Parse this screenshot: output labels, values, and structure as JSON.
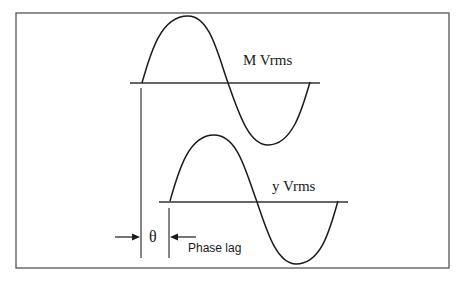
{
  "diagram": {
    "frame": {
      "x": 16,
      "y": 13,
      "width": 433,
      "height": 255,
      "stroke": "#555555"
    },
    "waves": [
      {
        "id": "reference",
        "label": "M Vrms",
        "label_pos": {
          "x": 243,
          "y": 65
        },
        "baseline": {
          "x1": 130,
          "x2": 320,
          "y": 83
        },
        "path": "M142,83 C150,55 160,16 188,16 C210,16 218,55 228,83 C238,110 248,145 268,145 C292,145 302,110 310,82"
      },
      {
        "id": "response",
        "label": "y Vrms",
        "label_pos": {
          "x": 272,
          "y": 191
        },
        "baseline": {
          "x1": 159,
          "x2": 348,
          "y": 202
        },
        "path": "M170,201 C178,173 188,135 214,135 C238,135 246,173 257,202 C266,228 276,264 296,264 C322,264 330,228 338,201"
      }
    ],
    "phase_markers": {
      "left_line": {
        "x": 141,
        "y1": 88,
        "y2": 258
      },
      "right_line": {
        "x": 169,
        "y1": 208,
        "y2": 258
      },
      "left_arrow": {
        "x1": 115,
        "x2": 140,
        "y": 237
      },
      "right_arrow": {
        "x1": 196,
        "x2": 170,
        "y": 237
      }
    },
    "labels": {
      "theta": "θ",
      "theta_pos": {
        "x": 149,
        "y": 242
      },
      "phase_lag": "Phase lag",
      "phase_lag_pos": {
        "x": 188,
        "y": 252
      }
    },
    "colors": {
      "line": "#1a1a1a",
      "frame": "#555555",
      "background": "#ffffff"
    }
  }
}
